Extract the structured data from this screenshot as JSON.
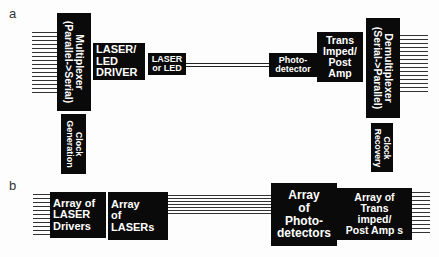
{
  "panels": {
    "a": {
      "label": "a",
      "multiplexer": {
        "line1": "Multiplexer",
        "line2": "(Parallel->Serial)"
      },
      "clock_generation": {
        "line1": "Clock",
        "line2": "Generation"
      },
      "laser_driver": {
        "line1": "LASER/",
        "line2": "LED",
        "line3": "DRIVER"
      },
      "laser_or_led": {
        "line1": "LASER",
        "line2": "or LED"
      },
      "photodetector": {
        "line1": "Photo-",
        "line2": "detector"
      },
      "trans_imped": {
        "line1": "Trans",
        "line2": "Imped/",
        "line3": "Post",
        "line4": "Amp"
      },
      "demultiplexer": {
        "line1": "Demultiplexer",
        "line2": "(Serial->Parallel)"
      },
      "clock_recovery": {
        "line1": "Clock",
        "line2": "Recovery"
      }
    },
    "b": {
      "label": "b",
      "laser_drivers_array": {
        "line1": "Array of",
        "line2": "LASER",
        "line3": "Drivers"
      },
      "lasers_array": {
        "line1": "Array",
        "line2": "of",
        "line3": "LASERs"
      },
      "photodetectors_array": {
        "line1": "Array",
        "line2": "of",
        "line3": "Photo-",
        "line4": "detectors"
      },
      "trans_imped_array": {
        "line1": "Array of",
        "line2": "Trans",
        "line3": "imped/",
        "line4": "Post Amp s"
      }
    }
  },
  "colors": {
    "box": "#0a0a0a",
    "text": "#ffffff",
    "line": "#333333"
  }
}
